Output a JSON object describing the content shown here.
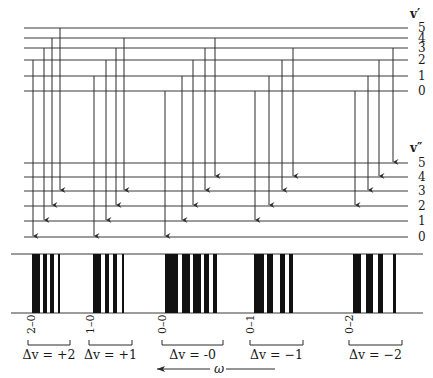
{
  "upper_state": {
    "label": "v′",
    "levels": [
      {
        "v": "0",
        "y": 91
      },
      {
        "v": "1",
        "y": 76
      },
      {
        "v": "2",
        "y": 60
      },
      {
        "v": "3",
        "y": 48
      },
      {
        "v": "4",
        "y": 38
      },
      {
        "v": "5",
        "y": 28
      }
    ]
  },
  "lower_state": {
    "label": "v″",
    "levels": [
      {
        "v": "0",
        "y": 237
      },
      {
        "v": "1",
        "y": 221
      },
      {
        "v": "2",
        "y": 206
      },
      {
        "v": "3",
        "y": 191
      },
      {
        "v": "4",
        "y": 177
      },
      {
        "v": "5",
        "y": 163
      }
    ]
  },
  "transitions": [
    {
      "group": 0,
      "from": 2,
      "to": 0,
      "x": 33
    },
    {
      "group": 0,
      "from": 3,
      "to": 1,
      "x": 44
    },
    {
      "group": 0,
      "from": 4,
      "to": 2,
      "x": 52
    },
    {
      "group": 0,
      "from": 5,
      "to": 3,
      "x": 60
    },
    {
      "group": 1,
      "from": 1,
      "to": 0,
      "x": 94
    },
    {
      "group": 1,
      "from": 2,
      "to": 1,
      "x": 106
    },
    {
      "group": 1,
      "from": 3,
      "to": 2,
      "x": 116
    },
    {
      "group": 1,
      "from": 4,
      "to": 3,
      "x": 124
    },
    {
      "group": 2,
      "from": 0,
      "to": 0,
      "x": 165
    },
    {
      "group": 2,
      "from": 1,
      "to": 1,
      "x": 182
    },
    {
      "group": 2,
      "from": 2,
      "to": 2,
      "x": 193
    },
    {
      "group": 2,
      "from": 3,
      "to": 3,
      "x": 205
    },
    {
      "group": 2,
      "from": 4,
      "to": 4,
      "x": 215
    },
    {
      "group": 3,
      "from": 0,
      "to": 1,
      "x": 255
    },
    {
      "group": 3,
      "from": 1,
      "to": 2,
      "x": 269
    },
    {
      "group": 3,
      "from": 2,
      "to": 3,
      "x": 282
    },
    {
      "group": 3,
      "from": 3,
      "to": 4,
      "x": 293
    },
    {
      "group": 4,
      "from": 0,
      "to": 2,
      "x": 355
    },
    {
      "group": 4,
      "from": 1,
      "to": 3,
      "x": 368
    },
    {
      "group": 4,
      "from": 2,
      "to": 4,
      "x": 379
    },
    {
      "group": 4,
      "from": 3,
      "to": 5,
      "x": 393
    }
  ],
  "spectrum": {
    "box": {
      "x1": 11,
      "x2": 423,
      "top": 254,
      "bottom": 313
    },
    "lines": [
      {
        "x": 32,
        "w": 8
      },
      {
        "x": 43,
        "w": 4
      },
      {
        "x": 50,
        "w": 4
      },
      {
        "x": 58,
        "w": 2
      },
      {
        "x": 93,
        "w": 8
      },
      {
        "x": 105,
        "w": 4
      },
      {
        "x": 113,
        "w": 4
      },
      {
        "x": 122,
        "w": 2
      },
      {
        "x": 165,
        "w": 13
      },
      {
        "x": 182,
        "w": 8
      },
      {
        "x": 193,
        "w": 8
      },
      {
        "x": 204,
        "w": 5
      },
      {
        "x": 213,
        "w": 4
      },
      {
        "x": 254,
        "w": 10
      },
      {
        "x": 267,
        "w": 6
      },
      {
        "x": 280,
        "w": 5
      },
      {
        "x": 289,
        "w": 4
      },
      {
        "x": 353,
        "w": 8
      },
      {
        "x": 366,
        "w": 7
      },
      {
        "x": 378,
        "w": 5
      },
      {
        "x": 393,
        "w": 3
      }
    ]
  },
  "bands": [
    {
      "origin": "2–0",
      "label": "Δv = +2",
      "x": 31,
      "bracket": [
        28,
        70
      ]
    },
    {
      "origin": "1–0",
      "label": "Δv = +1",
      "x": 90,
      "bracket": [
        89,
        132
      ]
    },
    {
      "origin": "0–0",
      "label": "Δv = -0",
      "x": 162,
      "bracket": [
        162,
        223
      ]
    },
    {
      "origin": "0–1",
      "label": "Δv = −1",
      "x": 250,
      "bracket": [
        250,
        303
      ]
    },
    {
      "origin": "0–2",
      "label": "Δv = −2",
      "x": 349,
      "bracket": [
        349,
        402
      ]
    }
  ],
  "axis": {
    "label": "ω",
    "direction": "decreasing to the left"
  }
}
